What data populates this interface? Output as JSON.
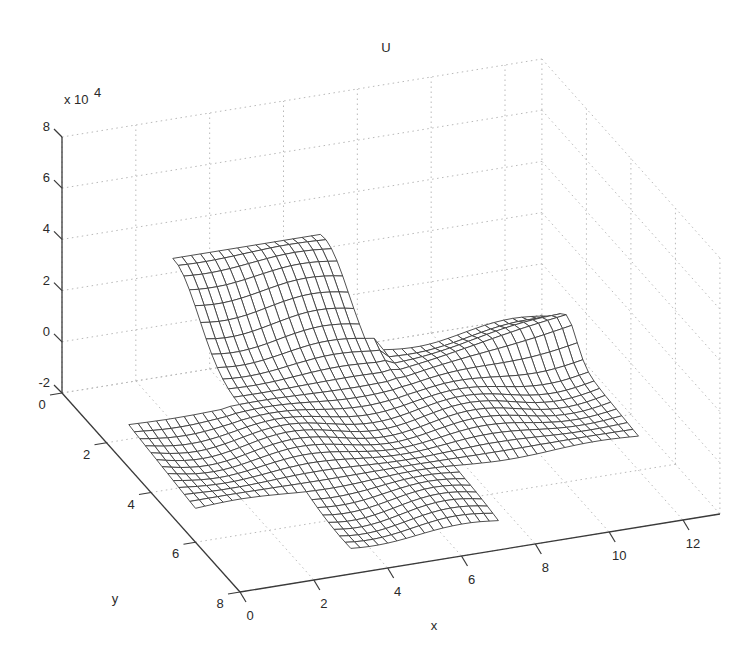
{
  "chart_data": {
    "type": "surface",
    "render": "mesh",
    "title": "U",
    "xlabel": "x",
    "ylabel": "y",
    "zlabel": "",
    "z_exponent_label": "x 10",
    "z_exponent_power": "4",
    "xlim": [
      0,
      13
    ],
    "ylim": [
      0,
      8
    ],
    "zlim": [
      -20000,
      80000
    ],
    "x_ticks": [
      0,
      2,
      4,
      6,
      8,
      10,
      12
    ],
    "y_ticks": [
      0,
      2,
      4,
      6,
      8
    ],
    "z_ticks": [
      -2,
      0,
      2,
      4,
      6,
      8
    ],
    "z_tick_scale": 10000,
    "grid": true,
    "box": false,
    "view": "3-D oblique (MATLAB default-like, azimuth ≈ -37.5°, elevation ≈ 30°)",
    "domain_description": "Cross / plus-shaped domain; mesh ~0.25 spacing",
    "domain_regions": [
      {
        "name": "left-arm",
        "x": [
          0,
          3
        ],
        "y": [
          3,
          6
        ]
      },
      {
        "name": "center",
        "x": [
          3,
          7
        ],
        "y": [
          0,
          8
        ]
      },
      {
        "name": "right-arm",
        "x": [
          7,
          12
        ],
        "y": [
          2,
          6
        ]
      }
    ],
    "surface_features": [
      {
        "description": "Raised ridge along back edge (y≈0..2) rising to ~2.5e4",
        "approx_max_z": 25000
      },
      {
        "description": "Sharp peak / spike at far right edge near x≈12, y≈3",
        "approx_z": 10000
      },
      {
        "description": "Front regions near z≈-1e4 to -1.5e4",
        "approx_min_z": -15000
      }
    ]
  },
  "figure": {
    "title": "U",
    "x_axis_title": "x",
    "y_axis_title": "y",
    "z_multiplier_base": "x 10",
    "z_multiplier_power": "4"
  }
}
